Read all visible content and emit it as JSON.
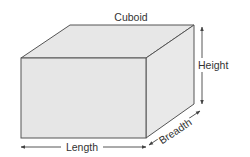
{
  "title": "Cuboid",
  "labels": {
    "length": "Length",
    "breadth": "Breadth",
    "height": "Height"
  },
  "colors": {
    "face_top": "#e7e7e7",
    "face_front": "#e6e6e6",
    "face_side": "#e9e9e9",
    "edge": "#555555",
    "arrow": "#444444",
    "text": "#333333"
  },
  "geometry": {
    "front": {
      "x1": 21,
      "y1": 58,
      "x2": 146,
      "y2": 138
    },
    "depth_offset": {
      "dx": 48,
      "dy": -33
    }
  }
}
